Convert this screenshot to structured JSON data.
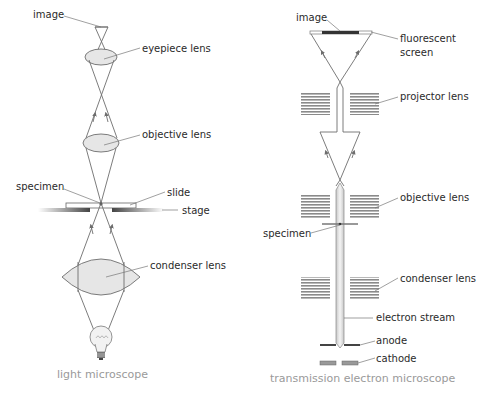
{
  "light": {
    "caption": "light microscope",
    "labels": {
      "image": "image",
      "eyepiece": "eyepiece lens",
      "objective": "objective lens",
      "specimen": "specimen",
      "slide": "slide",
      "stage": "stage",
      "condenser": "condenser lens"
    }
  },
  "tem": {
    "caption": "transmission electron microscope",
    "labels": {
      "image": "image",
      "screen_line1": "fluorescent",
      "screen_line2": "screen",
      "projector": "projector lens",
      "objective": "objective lens",
      "specimen": "specimen",
      "condenser": "condenser lens",
      "stream": "electron stream",
      "anode": "anode",
      "cathode": "cathode"
    }
  },
  "colors": {
    "lens_fill": "#e6e6e6",
    "ray": "#6d6d6d",
    "caption": "#9a9a9a",
    "coil": "#8a8a8a"
  }
}
